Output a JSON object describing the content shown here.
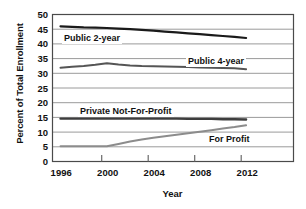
{
  "chart_data": {
    "type": "line",
    "title": "",
    "xlabel": "Year",
    "ylabel": "Percent of Total Enrollment",
    "x": [
      1996,
      1997,
      1998,
      1999,
      2000,
      2001,
      2002,
      2003,
      2004,
      2005,
      2006,
      2007,
      2008,
      2009,
      2010,
      2011,
      2012
    ],
    "xlim": [
      1995,
      2013
    ],
    "ylim": [
      0,
      50
    ],
    "xticks": [
      1996,
      2000,
      2004,
      2008,
      2012
    ],
    "yticks": [
      0,
      5,
      10,
      15,
      20,
      25,
      30,
      35,
      40,
      45,
      50
    ],
    "grid": true,
    "legend_position": "inline-labels",
    "series": [
      {
        "name": "Public 2-year",
        "color": "#1a1a1a",
        "values": [
          46.0,
          45.8,
          45.6,
          45.5,
          45.4,
          45.2,
          45.0,
          44.8,
          44.5,
          44.2,
          43.9,
          43.6,
          43.3,
          43.0,
          42.7,
          42.4,
          42.0
        ]
      },
      {
        "name": "Public 4-year",
        "color": "#555555",
        "values": [
          31.9,
          32.2,
          32.5,
          32.9,
          33.4,
          33.0,
          32.7,
          32.5,
          32.4,
          32.3,
          32.2,
          32.1,
          32.0,
          31.9,
          31.8,
          31.7,
          31.4
        ]
      },
      {
        "name": "Private Not-For-Profit",
        "color": "#3d3d3d",
        "values": [
          14.6,
          14.6,
          14.6,
          14.6,
          14.6,
          14.6,
          14.6,
          14.6,
          14.6,
          14.6,
          14.6,
          14.5,
          14.5,
          14.5,
          14.4,
          14.4,
          14.3
        ]
      },
      {
        "name": "For Profit",
        "color": "#8c8c8c",
        "values": [
          5.2,
          5.2,
          5.2,
          5.2,
          5.2,
          6.0,
          6.8,
          7.5,
          8.1,
          8.6,
          9.1,
          9.6,
          10.1,
          10.6,
          11.2,
          11.7,
          12.3
        ]
      }
    ],
    "series_labels": [
      {
        "text": "Public 2-year",
        "x": 62,
        "y": 37
      },
      {
        "text": "Public 4-year",
        "x": 186,
        "y": 60
      },
      {
        "text": "Private Not-For-Profit",
        "x": 78,
        "y": 110
      },
      {
        "text": "For Profit",
        "x": 207,
        "y": 138
      }
    ]
  }
}
